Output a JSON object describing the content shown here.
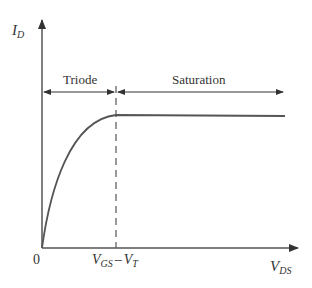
{
  "diagram": {
    "y_axis": {
      "main": "I",
      "sub": "D"
    },
    "x_axis": {
      "main": "V",
      "sub": "DS"
    },
    "origin_label": "0",
    "threshold_label": {
      "v1": "V",
      "s1": "GS",
      "minus": "–",
      "v2": "V",
      "s2": "T"
    },
    "regions": [
      {
        "name": "triode",
        "label": "Triode"
      },
      {
        "name": "saturation",
        "label": "Saturation"
      }
    ],
    "colors": {
      "line": "#555555",
      "text": "#333333",
      "background": "#ffffff"
    }
  }
}
